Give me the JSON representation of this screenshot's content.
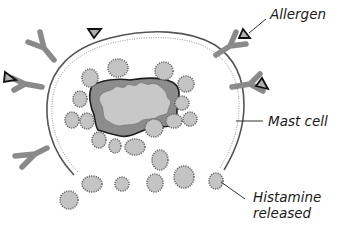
{
  "diagram": {
    "labels": {
      "allergen": "Allergen",
      "mast_cell": "Mast cell",
      "histamine_line1": "Histamine",
      "histamine_line2": "released"
    },
    "colors": {
      "membrane": "#555555",
      "receptor": "#8a8a8a",
      "granule_fill": "#c4c4c4",
      "granule_edge": "#666666",
      "nucleus_outer": "#8c8c8c",
      "nucleus_inner": "#c8c8c8",
      "nucleus_edge": "#1e1e1e",
      "allergen_fill": "#b0b0b0",
      "allergen_edge": "#111111",
      "text": "#1a1a1a"
    },
    "components": [
      {
        "name": "mast-cell",
        "label": "Mast cell"
      },
      {
        "name": "nucleus"
      },
      {
        "name": "granules-inside",
        "count": 17
      },
      {
        "name": "granules-released",
        "count": 8,
        "label": "Histamine released"
      },
      {
        "name": "ige-receptors",
        "count": 6
      },
      {
        "name": "allergens",
        "count": 4,
        "label": "Allergen"
      }
    ]
  }
}
